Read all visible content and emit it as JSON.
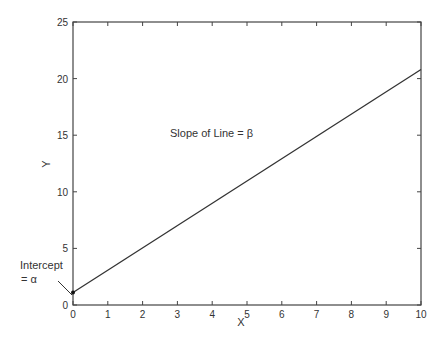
{
  "chart_data": {
    "type": "line",
    "title": "",
    "xlabel": "X",
    "ylabel": "Y",
    "xlim": [
      0,
      10
    ],
    "ylim": [
      0,
      25
    ],
    "x_ticks": [
      "0",
      "1",
      "2",
      "3",
      "4",
      "5",
      "6",
      "7",
      "8",
      "9",
      "10"
    ],
    "y_ticks": [
      "0",
      "5",
      "10",
      "15",
      "20",
      "25"
    ],
    "grid": false,
    "series": [
      {
        "name": "line",
        "x": [
          0,
          10
        ],
        "y": [
          1.1,
          20.8
        ]
      }
    ],
    "annotations": [
      {
        "text": "Slope of Line = β",
        "x": 3.3,
        "y": 15.5
      },
      {
        "text_line1": "Intercept",
        "text_line2": "= α",
        "target_x": 0,
        "target_y": 1.1
      }
    ]
  },
  "labels": {
    "slope": "Slope of Line = β",
    "intercept_line1": "Intercept",
    "intercept_line2": "= α",
    "xlabel": "X",
    "ylabel": "Y"
  }
}
